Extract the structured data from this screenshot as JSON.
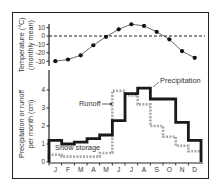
{
  "chart_data": [
    {
      "type": "line",
      "title": "",
      "xlabel": "",
      "ylabel": "Temperature (°C) (monthly mean)",
      "ylabel_line1": "Temperature (°C)",
      "ylabel_line2": "(monthly mean)",
      "categories": [
        "J",
        "F",
        "M",
        "A",
        "M",
        "J",
        "J",
        "A",
        "S",
        "O",
        "N",
        "D"
      ],
      "values": [
        -30,
        -28,
        -23,
        -11,
        -1,
        8,
        14,
        12,
        5,
        -4,
        -18,
        -26
      ],
      "yticks": [
        10,
        0,
        -10,
        -20,
        -30
      ],
      "ytick_labels": [
        "10",
        "0",
        "-10",
        "-20",
        "-30"
      ],
      "ylim": [
        -35,
        15
      ],
      "reference_line": {
        "y": 0,
        "style": "dashed"
      },
      "grid": false
    },
    {
      "type": "line",
      "subtype": "step",
      "title": "",
      "xlabel": "",
      "ylabel": "Precipitation or runoff per month (cm)",
      "ylabel_line1": "Precipitation or runoff",
      "ylabel_line2": "per month (cm)",
      "categories": [
        "J",
        "F",
        "M",
        "A",
        "M",
        "J",
        "J",
        "A",
        "S",
        "O",
        "N",
        "D"
      ],
      "series": [
        {
          "name": "Runoff",
          "style": "solid-dark",
          "values": [
            1.2,
            1.0,
            1.1,
            1.3,
            1.5,
            2.3,
            3.8,
            4.1,
            3.5,
            3.5,
            2.2,
            1.2
          ]
        },
        {
          "name": "Precipitation / Snow storage",
          "style": "dashed-gray",
          "values": [
            0.4,
            0.3,
            0.3,
            0.3,
            0.5,
            3.95,
            3.7,
            3.2,
            2.0,
            1.4,
            0.9,
            0.6
          ]
        }
      ],
      "annotations": [
        {
          "text": "Precipitation"
        },
        {
          "text": "Runoff"
        },
        {
          "text": "Snow storage"
        }
      ],
      "yticks": [
        0,
        1,
        2,
        3,
        4
      ],
      "ytick_labels": [
        "0",
        "1",
        "2",
        "3",
        "4"
      ],
      "ylim": [
        0,
        4.8
      ],
      "grid": false
    }
  ]
}
